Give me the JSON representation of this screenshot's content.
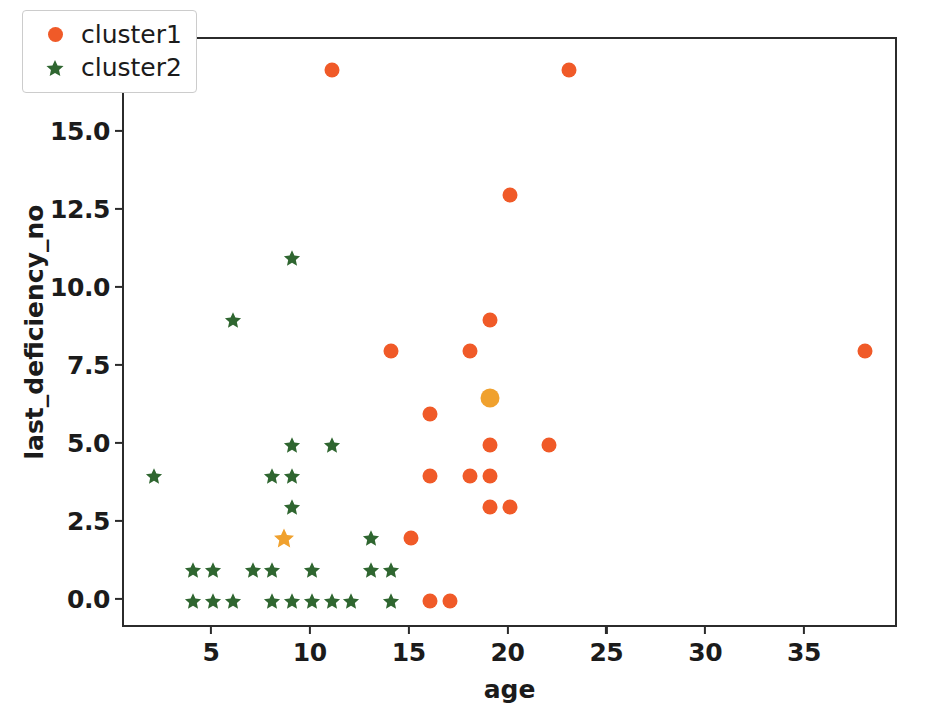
{
  "chart_data": {
    "type": "scatter",
    "title": "",
    "xlabel": "age",
    "ylabel": "last_deficiency_no",
    "xlim": [
      0.5,
      39.7
    ],
    "ylim": [
      -0.9,
      18.0
    ],
    "xticks": [
      "5",
      "10",
      "15",
      "20",
      "25",
      "30",
      "35"
    ],
    "xtick_values": [
      5,
      10,
      15,
      20,
      25,
      30,
      35
    ],
    "yticks": [
      "0.0",
      "2.5",
      "5.0",
      "7.5",
      "10.0",
      "12.5",
      "15.0",
      "17.5"
    ],
    "ytick_values": [
      0.0,
      2.5,
      5.0,
      7.5,
      10.0,
      12.5,
      15.0,
      17.5
    ],
    "grid": false,
    "legend_position": "upper left",
    "series": [
      {
        "name": "cluster1",
        "marker": "circle",
        "color": "#f05a28",
        "points": [
          [
            11,
            17
          ],
          [
            23,
            17
          ],
          [
            20,
            13
          ],
          [
            19,
            9
          ],
          [
            14,
            8
          ],
          [
            18,
            8
          ],
          [
            38,
            8
          ],
          [
            16,
            6
          ],
          [
            19,
            5
          ],
          [
            22,
            5
          ],
          [
            16,
            4
          ],
          [
            18,
            4
          ],
          [
            19,
            4
          ],
          [
            19,
            3
          ],
          [
            20,
            3
          ],
          [
            15,
            2
          ],
          [
            16,
            0
          ],
          [
            17,
            0
          ]
        ]
      },
      {
        "name": "cluster2",
        "marker": "star",
        "color": "#2f6630",
        "points": [
          [
            9,
            11
          ],
          [
            6,
            9
          ],
          [
            2,
            4
          ],
          [
            9,
            5
          ],
          [
            11,
            5
          ],
          [
            8,
            4
          ],
          [
            9,
            4
          ],
          [
            9,
            3
          ],
          [
            13,
            2
          ],
          [
            4,
            1
          ],
          [
            5,
            1
          ],
          [
            7,
            1
          ],
          [
            8,
            1
          ],
          [
            10,
            1
          ],
          [
            13,
            1
          ],
          [
            14,
            1
          ],
          [
            4,
            0
          ],
          [
            5,
            0
          ],
          [
            6,
            0
          ],
          [
            8,
            0
          ],
          [
            9,
            0
          ],
          [
            10,
            0
          ],
          [
            11,
            0
          ],
          [
            12,
            0
          ],
          [
            14,
            0
          ]
        ]
      },
      {
        "name": "centroid1",
        "marker": "circle",
        "color": "#f0a12e",
        "points": [
          [
            19,
            6.5
          ]
        ]
      },
      {
        "name": "centroid2",
        "marker": "star",
        "color": "#f0a12e",
        "points": [
          [
            8.6,
            2
          ]
        ]
      }
    ]
  },
  "legend": {
    "entries": [
      {
        "label": "cluster1",
        "marker": "circle",
        "color": "#f05a28"
      },
      {
        "label": "cluster2",
        "marker": "star",
        "color": "#2f6630"
      }
    ]
  },
  "axes": {
    "xlabel": "age",
    "ylabel": "last_deficiency_no",
    "frame_color": "#2b2b2b"
  }
}
